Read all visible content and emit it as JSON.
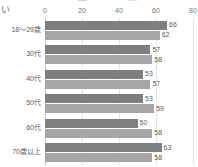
{
  "chart_data": {
    "type": "bar",
    "orientation": "horizontal",
    "title": "",
    "xlabel": "",
    "ylabel": "",
    "xlim": [
      0,
      80
    ],
    "xticks": [
      0,
      20,
      40,
      60,
      80
    ],
    "grid": true,
    "legend_position": "top",
    "axis_title_fragment": "い",
    "categories": [
      "18〜29歳",
      "30代",
      "40代",
      "50代",
      "60代",
      "70歳以上"
    ],
    "series": [
      {
        "name": "",
        "color": "#7f7f7f",
        "values": [
          66,
          57,
          53,
          53,
          50,
          63
        ]
      },
      {
        "name": "",
        "color": "#a6a6a6",
        "values": [
          62,
          58,
          57,
          59,
          58,
          58
        ]
      }
    ],
    "legend_entries": [
      {
        "label": "",
        "color": "#7f7f7f"
      },
      {
        "label": "",
        "color": "#a6a6a6"
      }
    ]
  },
  "colors": {
    "series_dark": "#7f7f7f",
    "series_light": "#a6a6a6",
    "gridline": "#e4e4e4",
    "axis": "#c8c8c8",
    "text": "#5a5a5a",
    "background": "#ffffff"
  }
}
